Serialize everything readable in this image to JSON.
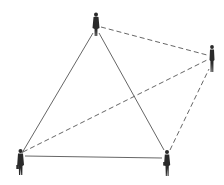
{
  "diagram": {
    "type": "network",
    "colors": {
      "background": "#ffffff",
      "figure": "#2a2a2a",
      "solid_line": "#555555",
      "dashed_line": "#555555"
    },
    "nodes": [
      {
        "id": "top",
        "x": 96,
        "y": 24
      },
      {
        "id": "right",
        "x": 212,
        "y": 58
      },
      {
        "id": "bottom-left",
        "x": 20,
        "y": 162
      },
      {
        "id": "bottom-right",
        "x": 167,
        "y": 162
      }
    ],
    "edges": [
      {
        "from": "top",
        "to": "bottom-left",
        "style": "solid"
      },
      {
        "from": "top",
        "to": "bottom-right",
        "style": "solid"
      },
      {
        "from": "bottom-left",
        "to": "bottom-right",
        "style": "solid"
      },
      {
        "from": "top",
        "to": "right",
        "style": "dashed"
      },
      {
        "from": "bottom-left",
        "to": "right",
        "style": "dashed"
      },
      {
        "from": "bottom-right",
        "to": "right",
        "style": "dashed"
      }
    ]
  }
}
